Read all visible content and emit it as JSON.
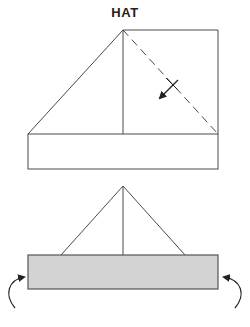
{
  "title": "HAT",
  "colors": {
    "line": "#4a4a4a",
    "fill_band": "#d3d3d3",
    "background": "#ffffff"
  },
  "steps": [
    {
      "step": 1,
      "description": "Square with left triangle folded, vertical center crease, dashed diagonal fold line on right, arrow indicating fold down-left, band rectangle at bottom",
      "elements": [
        "square",
        "left-triangle",
        "center-crease",
        "dashed-diagonal-fold",
        "fold-arrow",
        "bottom-band"
      ]
    },
    {
      "step": 2,
      "description": "Triangle hat shape on shaded band with curved arrows on both sides indicating folding band ends",
      "elements": [
        "triangle",
        "center-crease",
        "shaded-band",
        "left-curved-arrow",
        "right-curved-arrow"
      ]
    }
  ]
}
